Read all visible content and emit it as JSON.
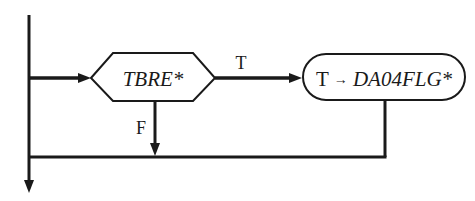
{
  "diagram": {
    "type": "flowchart",
    "decision": {
      "text": "TBRE*",
      "shape": "hexagon"
    },
    "action": {
      "prefix": "T",
      "arrow": "→",
      "text": "DA04FLG*",
      "shape": "rounded-rectangle"
    },
    "branches": {
      "true_label": "T",
      "false_label": "F"
    },
    "colors": {
      "stroke": "#1a1a1a",
      "background": "#ffffff"
    }
  }
}
